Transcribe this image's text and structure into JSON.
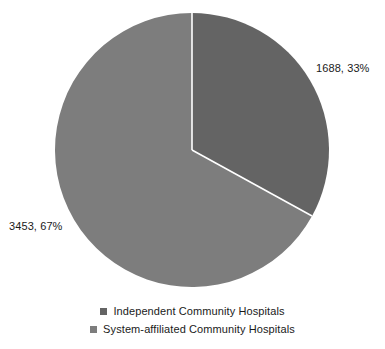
{
  "chart_data": {
    "type": "pie",
    "title": "",
    "subtitle": "",
    "xlabel": "",
    "ylabel": "",
    "grid": false,
    "legend_position": "bottom",
    "total": 5141,
    "start_angle_deg": 0,
    "direction": "clockwise",
    "categories": [
      "Independent Community Hospitals",
      "System-affiliated Community Hospitals"
    ],
    "values": [
      1688,
      3453
    ],
    "percents": [
      33,
      67
    ],
    "data_labels": [
      "1688, 33%",
      "3453, 67%"
    ],
    "colors": [
      "#646464",
      "#7d7d7d"
    ],
    "separator_color": "#ffffff",
    "background": "#ffffff",
    "text_color": "#1a1a1a",
    "slices": [
      {
        "name": "Independent Community Hospitals",
        "value": 1688,
        "percent": 33,
        "label": "1688, 33%",
        "color": "#646464",
        "start_deg": 0,
        "sweep_deg": 118.8
      },
      {
        "name": "System-affiliated Community Hospitals",
        "value": 3453,
        "percent": 67,
        "label": "3453, 67%",
        "color": "#7d7d7d",
        "start_deg": 118.8,
        "sweep_deg": 241.2
      }
    ],
    "geometry": {
      "center_x": 192,
      "center_y": 150,
      "radius": 137
    }
  },
  "legend": {
    "items": [
      {
        "label": "Independent Community Hospitals",
        "color": "#646464"
      },
      {
        "label": "System-affiliated Community Hospitals",
        "color": "#7d7d7d"
      }
    ]
  }
}
